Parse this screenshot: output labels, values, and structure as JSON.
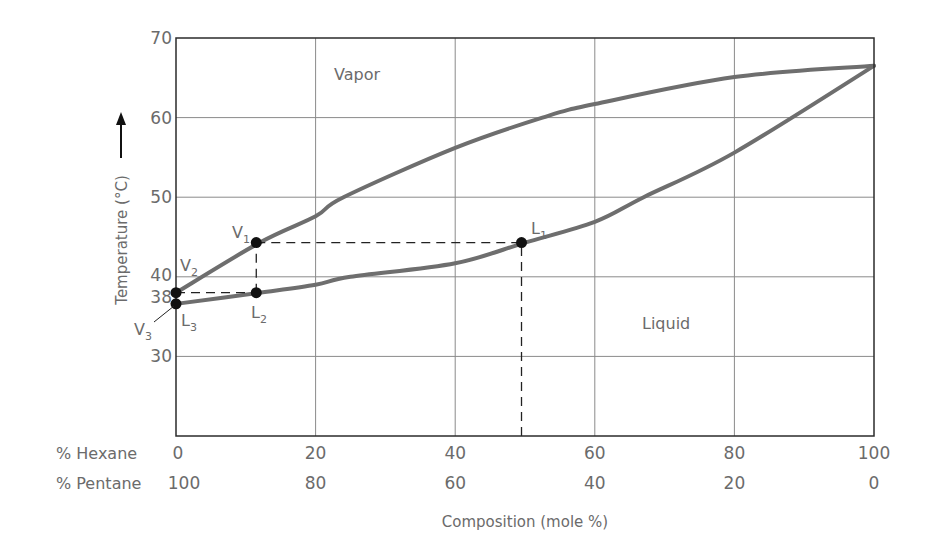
{
  "chart_data": {
    "type": "line",
    "title": "",
    "subtitle": "Temperature–composition phase diagram (pentane / hexane)",
    "xlabel": "Composition (mole %)",
    "ylabel": "Temperature (°C)",
    "x_rows": [
      {
        "label": "% Hexane",
        "ticks": [
          "0",
          "20",
          "40",
          "60",
          "80",
          "100"
        ]
      },
      {
        "label": "% Pentane",
        "ticks": [
          "100",
          "80",
          "60",
          "40",
          "20",
          "0"
        ]
      }
    ],
    "xlim": [
      0,
      100
    ],
    "ylim": [
      20,
      70
    ],
    "y_ticks": [
      "70",
      "60",
      "50",
      "40",
      "38",
      "30"
    ],
    "y_tick_values": [
      70,
      60,
      50,
      40,
      38,
      30
    ],
    "grid": true,
    "legend": null,
    "regions": [
      {
        "label": "Vapor",
        "x": 30,
        "y": 66
      },
      {
        "label": "Liquid",
        "x": 70,
        "y": 34
      }
    ],
    "series": [
      {
        "name": "Vapor curve (dew point)",
        "x": [
          0,
          12,
          20,
          24,
          40,
          52.5,
          60,
          80,
          100
        ],
        "y": [
          38,
          44.3,
          47.6,
          50,
          56.2,
          60,
          61.7,
          65.1,
          66.5
        ]
      },
      {
        "name": "Liquid curve (boiling point)",
        "x": [
          0,
          12,
          20,
          25,
          40,
          50,
          60,
          67,
          80,
          100
        ],
        "y": [
          36.6,
          38,
          39,
          40,
          41.7,
          44.3,
          46.9,
          50,
          55.6,
          66.5
        ]
      }
    ],
    "points": [
      {
        "label": "V",
        "sub": "1",
        "x": 11.5,
        "y": 44.3
      },
      {
        "label": "L",
        "sub": "1",
        "x": 49.5,
        "y": 44.3
      },
      {
        "label": "V",
        "sub": "2",
        "x": 0,
        "y": 38
      },
      {
        "label": "L",
        "sub": "2",
        "x": 11.5,
        "y": 38
      },
      {
        "label": "V",
        "sub": "3",
        "x": 0,
        "y": 36.6
      },
      {
        "label": "L",
        "sub": "3",
        "x": 0,
        "y": 36.6
      }
    ],
    "annotations": [
      {
        "type": "dashed",
        "from": [
          49.5,
          20
        ],
        "to": [
          49.5,
          44.3
        ]
      },
      {
        "type": "dashed",
        "from": [
          11.5,
          44.3
        ],
        "to": [
          49.5,
          44.3
        ]
      },
      {
        "type": "dashed",
        "from": [
          11.5,
          38
        ],
        "to": [
          11.5,
          44.3
        ]
      },
      {
        "type": "dashed",
        "from": [
          0,
          38
        ],
        "to": [
          11.5,
          38
        ]
      },
      {
        "type": "arrow",
        "text": "↑ next to y-axis label"
      }
    ]
  },
  "labels": {
    "vapor": "Vapor",
    "liquid": "Liquid",
    "ylabel": "Temperature (°C)",
    "xlabel": "Composition (mole %)",
    "hexane_row": "% Hexane",
    "pentane_row": "% Pentane",
    "V": "V",
    "L": "L",
    "s1": "1",
    "s2": "2",
    "s3": "3"
  },
  "colors": {
    "curve": "#6e6e6e",
    "grid": "#8a8a8a",
    "frame": "#2b2b2b",
    "text": "#6b6b6b",
    "dash": "#222222",
    "dot": "#111111"
  }
}
